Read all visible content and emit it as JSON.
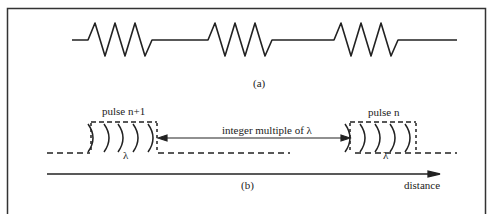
{
  "figure": {
    "part_a": {
      "label": "(a)",
      "pulses": 3,
      "cycles_per_pulse": 3
    },
    "part_b": {
      "label": "(b)",
      "pulse_left_label": "pulse n+1",
      "pulse_right_label": "pulse n",
      "separation_label": "integer multiple of λ",
      "wavelength_symbol_left": "λ",
      "wavelength_symbol_right": "λ",
      "axis_label": "distance"
    }
  },
  "colors": {
    "stroke": "#222222",
    "background": "#ffffff"
  }
}
